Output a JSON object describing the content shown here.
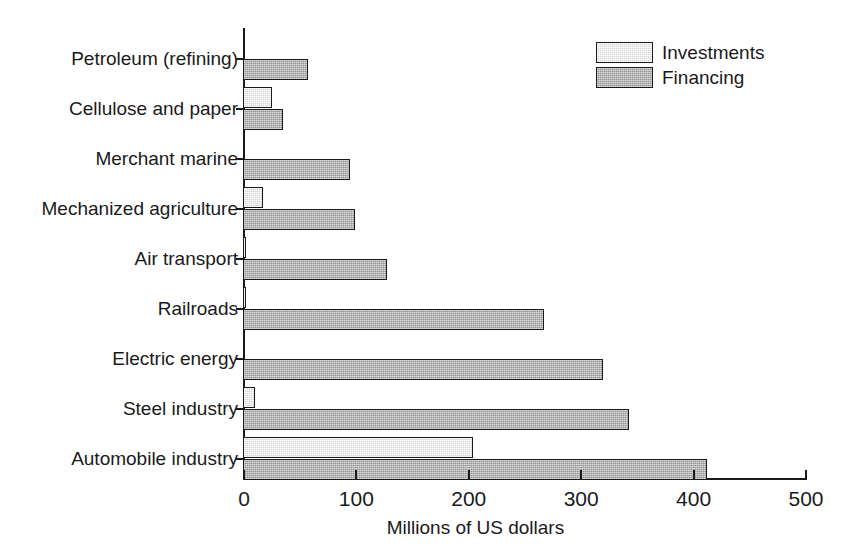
{
  "chart_data": {
    "type": "bar",
    "orientation": "horizontal",
    "title": "",
    "xlabel": "Millions of US dollars",
    "ylabel": "",
    "xlim": [
      0,
      500
    ],
    "xticks": [
      0,
      100,
      200,
      300,
      400,
      500
    ],
    "xtick_labels": [
      "0",
      "100",
      "200",
      "300",
      "400",
      "500"
    ],
    "grid": false,
    "legend_position": "top-right",
    "categories": [
      "Petroleum (refining)",
      "Cellulose and paper",
      "Merchant marine",
      "Mechanized agriculture",
      "Air transport",
      "Railroads",
      "Electric energy",
      "Steel industry",
      "Automobile industry"
    ],
    "series": [
      {
        "name": "Investments",
        "color": "#d4d4d4",
        "values": [
          0,
          26,
          0,
          18,
          2,
          2,
          0,
          11,
          205
        ]
      },
      {
        "name": "Financing",
        "color": "#949494",
        "values": [
          58,
          36,
          95,
          100,
          128,
          268,
          320,
          343,
          413
        ]
      }
    ]
  },
  "legend": {
    "items": [
      {
        "label": "Investments",
        "swatch": "investments"
      },
      {
        "label": "Financing",
        "swatch": "financing"
      }
    ]
  },
  "colors": {
    "investments": "#d4d4d4",
    "financing": "#949494",
    "axis": "#1a1a1a",
    "background": "#ffffff"
  }
}
